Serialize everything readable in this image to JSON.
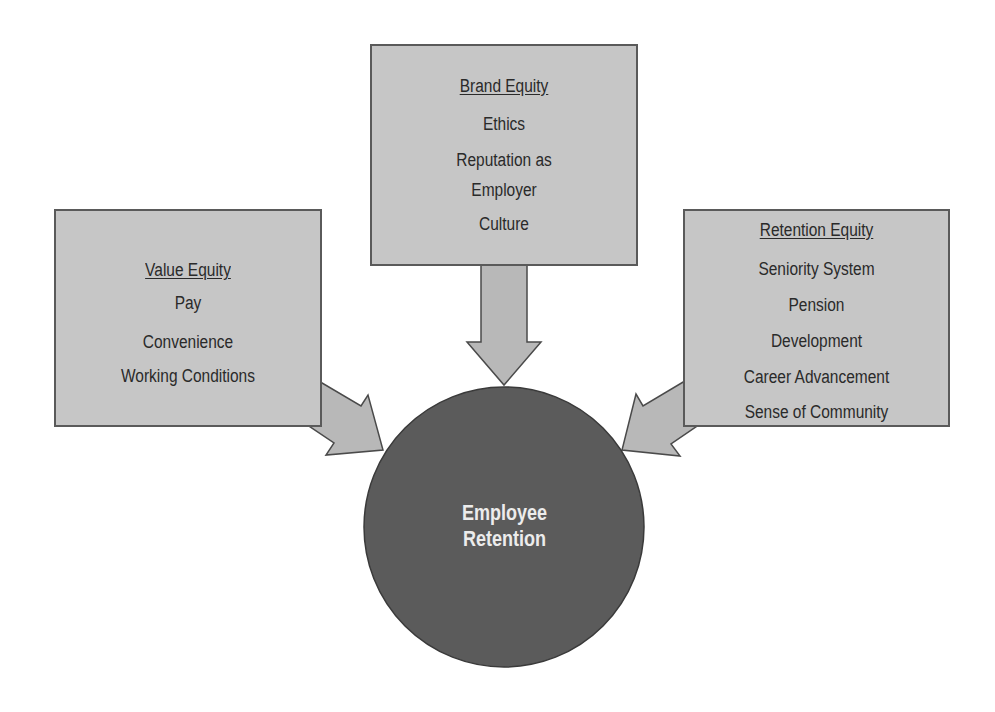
{
  "diagram": {
    "title": "Employee Retention",
    "center": {
      "line1": "Employee",
      "line2": "Retention"
    },
    "boxes": {
      "value": {
        "heading": "Value Equity",
        "items": [
          "Pay",
          "Convenience",
          "Working Conditions"
        ]
      },
      "brand": {
        "heading": "Brand Equity",
        "items": [
          "Ethics",
          "Reputation as",
          "Employer",
          "Culture"
        ]
      },
      "retention": {
        "heading": "Retention Equity",
        "items": [
          "Seniority System",
          "Pension",
          "Development",
          "Career Advancement",
          "Sense of Community"
        ]
      }
    },
    "colors": {
      "box_fill": "#c6c6c6",
      "border": "#5a5a5a",
      "arrow_fill": "#b8b8b8",
      "circle_fill": "#5b5b5b",
      "circle_text": "#ececec",
      "text": "#2a2a2a"
    }
  }
}
